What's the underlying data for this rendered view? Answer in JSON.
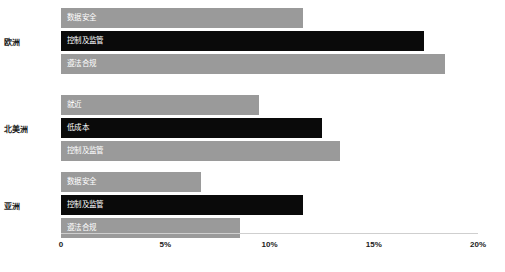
{
  "chart_data": {
    "type": "bar",
    "orientation": "horizontal",
    "title": "",
    "xlabel": "",
    "ylabel": "",
    "xlim": [
      0,
      20
    ],
    "xticks": [
      0,
      5,
      10,
      15,
      20
    ],
    "xtick_labels": [
      "0",
      "5%",
      "10%",
      "15%",
      "20%"
    ],
    "grid": false,
    "legend": "none",
    "value_unit": "%",
    "categories": [
      "欧洲",
      "北美洲",
      "亚洲"
    ],
    "groups": [
      {
        "category": "欧洲",
        "bars": [
          {
            "label": "数据安全",
            "value": 11.6,
            "color": "#9a9a9a"
          },
          {
            "label": "控制及监管",
            "value": 17.4,
            "color": "#0a0a0a"
          },
          {
            "label": "遵法合规",
            "value": 18.4,
            "color": "#9a9a9a"
          }
        ]
      },
      {
        "category": "北美洲",
        "bars": [
          {
            "label": "就近",
            "value": 9.5,
            "color": "#9a9a9a"
          },
          {
            "label": "低成本",
            "value": 12.5,
            "color": "#0a0a0a"
          },
          {
            "label": "控制及监管",
            "value": 13.4,
            "color": "#9a9a9a"
          }
        ]
      },
      {
        "category": "亚洲",
        "bars": [
          {
            "label": "数据安全",
            "value": 6.7,
            "color": "#9a9a9a"
          },
          {
            "label": "控制及监管",
            "value": 11.6,
            "color": "#0a0a0a"
          },
          {
            "label": "遵法合规",
            "value": 8.6,
            "color": "#9a9a9a"
          }
        ]
      }
    ],
    "colors": {
      "light_bar": "#9a9a9a",
      "dark_bar": "#0a0a0a",
      "bar_text": "#ffffff",
      "axis_text": "#1b1b1b",
      "axis_line": "#cfcfcf",
      "background": "#ffffff"
    }
  }
}
